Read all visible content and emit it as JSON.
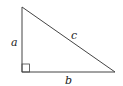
{
  "diagram": {
    "type": "right-triangle",
    "labels": {
      "a": "a",
      "b": "b",
      "c": "c"
    },
    "stroke_color": "#444444",
    "right_angle_marker": true
  }
}
